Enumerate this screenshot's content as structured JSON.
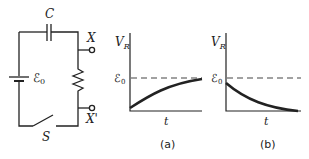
{
  "circuit": {
    "capacitor_label": "C",
    "emf_label": "ℰ",
    "emf_subscript": "0",
    "switch_label": "S",
    "terminal_top_label": "X",
    "terminal_bottom_label": "X'"
  },
  "graphs": [
    {
      "id": "a",
      "y_label": "V",
      "y_label_sub": "R",
      "x_label": "t",
      "level_label": "ℰ",
      "level_sub": "0",
      "caption": "(a)",
      "curve": "rising exponential approaching ℰ0"
    },
    {
      "id": "b",
      "y_label": "V",
      "y_label_sub": "R",
      "x_label": "t",
      "level_label": "ℰ",
      "level_sub": "0",
      "caption": "(b)",
      "curve": "decaying exponential from ℰ0 to 0"
    }
  ],
  "colors": {
    "line": "#222222",
    "dashed": "#555555"
  }
}
